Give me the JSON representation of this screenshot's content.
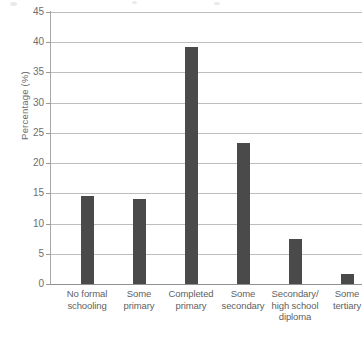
{
  "chart_data": {
    "type": "bar",
    "title": "",
    "xlabel": "",
    "ylabel": "Percentage (%)",
    "ylim": [
      0,
      45
    ],
    "ytick_step": 5,
    "yticks": [
      45,
      40,
      35,
      30,
      25,
      20,
      15,
      10,
      5,
      0
    ],
    "grid": true,
    "legend": "none",
    "bar_color": "#4a4a4a",
    "gridline_color": "#bdbdbd",
    "axis_color": "#8f8f8f",
    "categories": [
      "No formal schooling",
      "Some primary",
      "Completed primary",
      "Some secondary",
      "Secondary/ high school diploma",
      "Some tertiary"
    ],
    "category_lines": [
      [
        "No formal",
        "schooling"
      ],
      [
        "Some",
        "primary"
      ],
      [
        "Completed",
        "primary"
      ],
      [
        "Some",
        "secondary"
      ],
      [
        "Secondary/",
        "high school",
        "diploma"
      ],
      [
        "Some",
        "tertiary"
      ]
    ],
    "values": [
      14.6,
      14.0,
      39.2,
      23.3,
      7.5,
      1.6
    ]
  }
}
